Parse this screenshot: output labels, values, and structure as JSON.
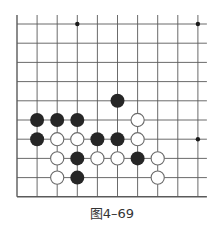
{
  "figure": {
    "caption": "图4–69",
    "board_excerpt": {
      "columns": 10,
      "rows": 10,
      "origin_px": [
        17,
        24
      ],
      "spacing_px": [
        20.1,
        19.2
      ],
      "edges": {
        "left": true,
        "bottom": true,
        "top": false,
        "right": false
      },
      "line_color": "#5a5a5a",
      "black_color": "#262626",
      "white_fill": "#ffffff",
      "white_stroke": "#6a6a6a"
    },
    "star_points": [
      [
        3,
        0
      ],
      [
        9,
        0
      ],
      [
        9,
        6
      ]
    ],
    "stones": {
      "black": [
        [
          5,
          4
        ],
        [
          1,
          5
        ],
        [
          2,
          5
        ],
        [
          3,
          5
        ],
        [
          1,
          6
        ],
        [
          4,
          6
        ],
        [
          5,
          6
        ],
        [
          3,
          7
        ],
        [
          6,
          7
        ],
        [
          3,
          8
        ]
      ],
      "white": [
        [
          6,
          5
        ],
        [
          2,
          6
        ],
        [
          3,
          6
        ],
        [
          6,
          6
        ],
        [
          2,
          7
        ],
        [
          4,
          7
        ],
        [
          5,
          7
        ],
        [
          7,
          7
        ],
        [
          2,
          8
        ],
        [
          7,
          8
        ]
      ]
    }
  }
}
